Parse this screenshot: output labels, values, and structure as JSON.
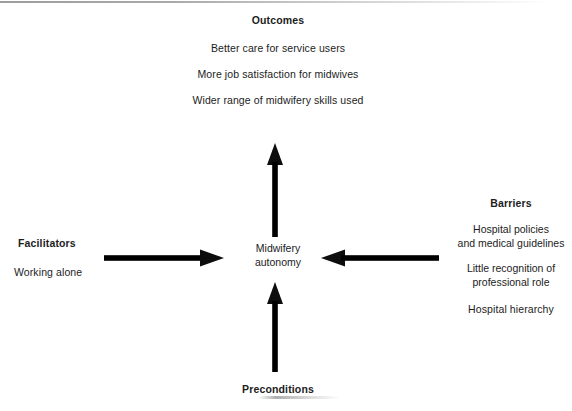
{
  "diagram": {
    "title_not_shown": "",
    "background_color": "#ffffff",
    "ink_color": "#0d0d0d",
    "center": {
      "line1": "Midwifery",
      "line2": "autonomy"
    },
    "outcomes": {
      "heading": "Outcomes",
      "items": [
        "Better care for service users",
        "More job satisfaction for midwives",
        "Wider range of midwifery skills used"
      ]
    },
    "facilitators": {
      "heading": "Facilitators",
      "items": [
        "Working alone"
      ]
    },
    "barriers": {
      "heading": "Barriers",
      "items": [
        "Hospital policies\nand medical guidelines",
        "Little recognition of\nprofessional role",
        "Hospital hierarchy"
      ],
      "item1_line1": "Hospital policies",
      "item1_line2": "and medical guidelines",
      "item2_line1": "Little recognition of",
      "item2_line2": "professional role",
      "item3_line1": "Hospital hierarchy"
    },
    "preconditions": {
      "heading": "Preconditions"
    },
    "arrows": [
      {
        "name": "arrow-up-to-outcomes",
        "direction": "up",
        "from": "Midwifery autonomy",
        "to": "Outcomes"
      },
      {
        "name": "arrow-facilitators-to-center",
        "direction": "right",
        "from": "Facilitators",
        "to": "Midwifery autonomy"
      },
      {
        "name": "arrow-barriers-to-center",
        "direction": "left",
        "from": "Barriers",
        "to": "Midwifery autonomy"
      },
      {
        "name": "arrow-preconditions-to-center",
        "direction": "up",
        "from": "Preconditions",
        "to": "Midwifery autonomy"
      }
    ]
  }
}
